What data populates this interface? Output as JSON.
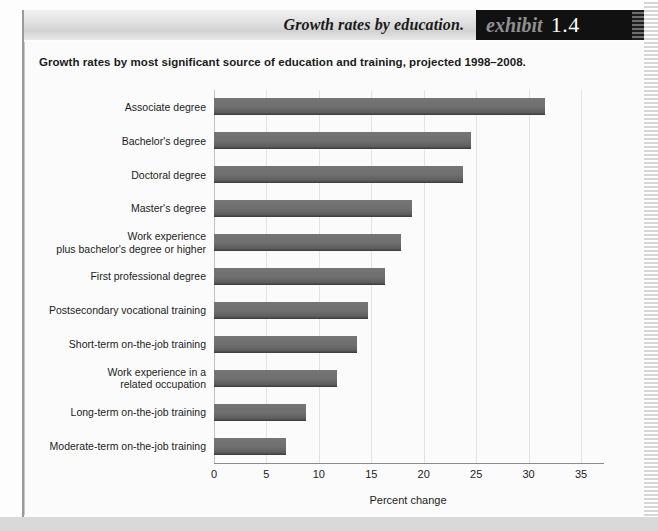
{
  "header": {
    "title": "Growth rates by education.",
    "exhibit_word": "exhibit",
    "exhibit_number": "1.4"
  },
  "subtitle": "Growth rates by most significant source of education and training, projected 1998–2008.",
  "colors": {
    "bar": "#6f6f6f",
    "bar_edge": "#3f3f3f",
    "gridline": "#e4e4e4",
    "axis": "#8c8c8c",
    "exhibit_box": "#111111",
    "exhibit_word": "#8f8f8f",
    "exhibit_number": "#ffffff",
    "text": "#1c1c1c"
  },
  "chart_data": {
    "type": "bar",
    "orientation": "horizontal",
    "title": "Growth rates by education.",
    "subtitle": "Growth rates by most significant source of education and training, projected 1998–2008.",
    "xlabel": "Percent change",
    "ylabel": "",
    "xlim": [
      0,
      37
    ],
    "xticks": [
      0,
      5,
      10,
      15,
      20,
      25,
      30,
      35
    ],
    "xtick_labels": [
      "0",
      "5",
      "10",
      "15",
      "20",
      "25",
      "30",
      "35"
    ],
    "grid": "vertical",
    "legend": null,
    "categories": [
      "Associate degree",
      "Bachelor's degree",
      "Doctoral degree",
      "Master's degree",
      "Work experience\nplus bachelor's degree or higher",
      "First professional degree",
      "Postsecondary vocational training",
      "Short-term on-the-job training",
      "Work experience in a\nrelated occupation",
      "Long-term on-the-job training",
      "Moderate-term on-the-job training"
    ],
    "values": [
      31.6,
      24.5,
      23.7,
      18.9,
      17.8,
      16.3,
      14.7,
      13.6,
      11.7,
      8.8,
      6.9
    ],
    "units": "percent"
  }
}
